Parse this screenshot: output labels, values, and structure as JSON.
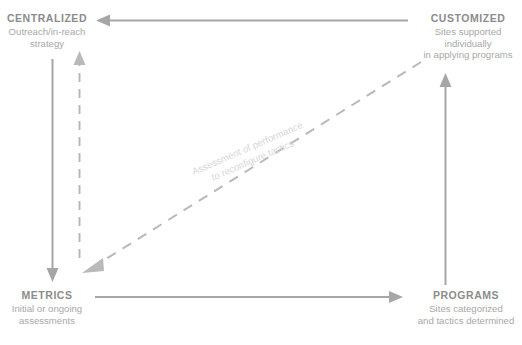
{
  "diagram": {
    "type": "cycle-quadrant-diagram",
    "colors": {
      "title_text": "#8c8c8c",
      "description_text": "#a8a8a8",
      "solid_arrow": "#a6a6a6",
      "dashed_arrow": "#b9b9b9",
      "diagonal_label_text": "#d6d6d6",
      "background": "#ffffff"
    },
    "nodes": [
      {
        "id": "centralized",
        "title": "CENTRALIZED",
        "description_lines": [
          "Outreach/in-reach",
          "strategy"
        ],
        "position": "top-left"
      },
      {
        "id": "customized",
        "title": "CUSTOMIZED",
        "description_lines": [
          "Sites supported individually",
          "in applying programs"
        ],
        "position": "top-right"
      },
      {
        "id": "metrics",
        "title": "METRICS",
        "description_lines": [
          "Initial or ongoing",
          "assessments"
        ],
        "position": "bottom-left"
      },
      {
        "id": "programs",
        "title": "PROGRAMS",
        "description_lines": [
          "Sites categorized",
          "and tactics determined"
        ],
        "position": "bottom-right"
      }
    ],
    "connectors": [
      {
        "id": "customized-to-centralized",
        "style": "solid",
        "direction": "right-to-left",
        "from": "customized",
        "to": "centralized"
      },
      {
        "id": "centralized-to-metrics",
        "style": "solid",
        "direction": "top-to-bottom",
        "from": "centralized",
        "to": "metrics"
      },
      {
        "id": "metrics-to-programs",
        "style": "solid",
        "direction": "left-to-right",
        "from": "metrics",
        "to": "programs"
      },
      {
        "id": "programs-to-customized",
        "style": "solid",
        "direction": "bottom-to-top",
        "from": "programs",
        "to": "customized"
      },
      {
        "id": "metrics-to-centralized-feedback",
        "style": "dashed",
        "direction": "bottom-to-top",
        "from": "metrics",
        "to": "centralized"
      },
      {
        "id": "customized-to-metrics-assessment",
        "style": "dashed",
        "direction": "top-right-to-bottom-left",
        "from": "customized",
        "to": "metrics",
        "label_lines": [
          "Assessment of performance",
          "to reconfigure tactics"
        ]
      }
    ]
  }
}
